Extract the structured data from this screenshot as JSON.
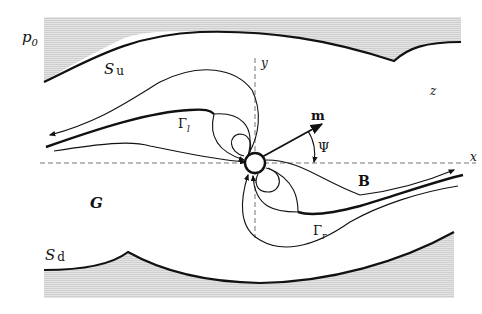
{
  "figure": {
    "type": "schematic",
    "labels": {
      "pressure": "p",
      "pressure_sub": "0",
      "upper_surface": "S",
      "upper_surface_sub": "u",
      "lower_surface": "S",
      "lower_surface_sub": "d",
      "region": "G",
      "x_axis": "x",
      "y_axis": "y",
      "z_axis": "z",
      "moment": "m",
      "angle": "Ψ",
      "field": "B",
      "gamma_left": "Γ",
      "gamma_left_sub": "l",
      "gamma_right": "Γ",
      "gamma_right_sub": "r"
    },
    "colors": {
      "line": "#111111",
      "axis": "#777777",
      "shade": "#d9d9d9"
    }
  }
}
